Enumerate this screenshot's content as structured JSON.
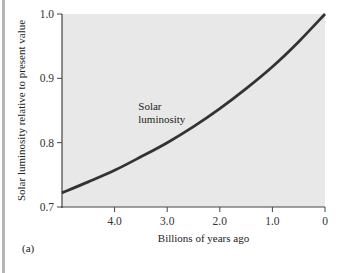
{
  "chart_data": {
    "type": "line",
    "title": "",
    "xlabel": "Billions of years ago",
    "ylabel": "Solar luminosity relative to present value",
    "xlim": [
      5.0,
      0
    ],
    "ylim": [
      0.7,
      1.0
    ],
    "x_ticks": [
      4.0,
      3.0,
      2.0,
      1.0,
      0
    ],
    "x_tick_labels": [
      "4.0",
      "3.0",
      "2.0",
      "1.0",
      "0"
    ],
    "y_ticks": [
      0.7,
      0.8,
      0.9,
      1.0
    ],
    "y_tick_labels": [
      "0.7",
      "0.8",
      "0.9",
      "1.0"
    ],
    "grid": false,
    "series": [
      {
        "name": "Solar luminosity",
        "x": [
          5.0,
          4.5,
          4.0,
          3.5,
          3.0,
          2.5,
          2.0,
          1.5,
          1.0,
          0.5,
          0
        ],
        "values": [
          0.722,
          0.739,
          0.757,
          0.778,
          0.8,
          0.825,
          0.853,
          0.884,
          0.918,
          0.957,
          1.0
        ]
      }
    ],
    "annotations": [
      {
        "text_lines": [
          "Solar",
          "luminosity"
        ],
        "x": 3.55,
        "y": 0.81
      }
    ],
    "panel_label": "(a)",
    "colors": {
      "plot_background": "#e8e8e8",
      "line": "#333333",
      "axis": "#444444"
    }
  }
}
